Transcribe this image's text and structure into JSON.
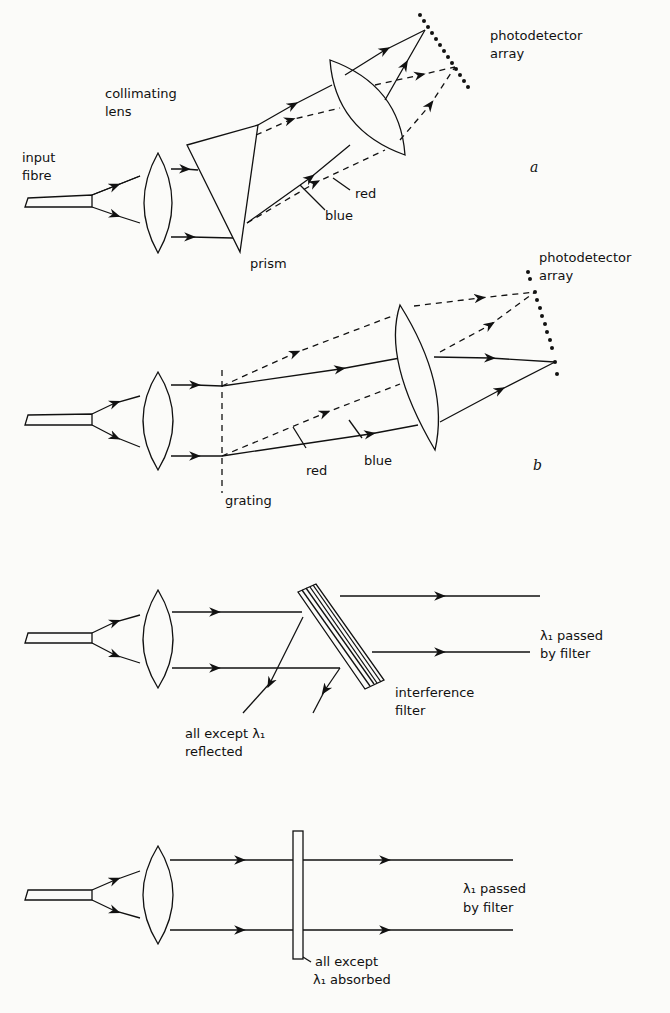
{
  "diagrams": {
    "a": {
      "label": "a",
      "input_fibre": [
        "input",
        "fibre"
      ],
      "collimating_lens": [
        "collimating",
        "lens"
      ],
      "prism": "prism",
      "photodetector_array": [
        "photodetector",
        "array"
      ],
      "ray_red": "red",
      "ray_blue": "blue"
    },
    "b": {
      "label": "b",
      "grating": "grating",
      "photodetector_array": [
        "photodetector",
        "array"
      ],
      "ray_red": "red",
      "ray_blue": "blue"
    },
    "c": {
      "interference_filter": [
        "interference",
        "filter"
      ],
      "reflected": [
        "all except λ₁",
        "reflected"
      ],
      "passed": [
        "λ₁ passed",
        "by filter"
      ]
    },
    "d": {
      "absorbed": [
        "all except",
        "λ₁ absorbed"
      ],
      "passed": [
        "λ₁ passed",
        "by filter"
      ]
    }
  }
}
